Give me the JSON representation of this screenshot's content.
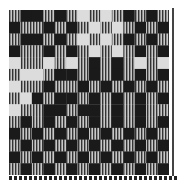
{
  "image": {
    "subject": "woven textile sample with checkered block pattern",
    "colors": {
      "dark": "#1a1a1a",
      "light": "#dcdcdc",
      "stripe_dark": "#3a3a3a",
      "stripe_light": "#bdbdbd"
    },
    "grid": {
      "cols": 14,
      "rows": 14,
      "legend": {
        "0": "light",
        "1": "dark",
        "2": "striped"
      },
      "cells": [
        [
          2,
          1,
          1,
          2,
          1,
          2,
          0,
          2,
          0,
          2,
          1,
          2,
          1,
          2
        ],
        [
          1,
          2,
          2,
          1,
          2,
          1,
          2,
          0,
          2,
          0,
          2,
          1,
          2,
          1
        ],
        [
          2,
          1,
          1,
          2,
          1,
          2,
          0,
          2,
          0,
          2,
          1,
          2,
          1,
          2
        ],
        [
          1,
          2,
          2,
          1,
          2,
          1,
          2,
          0,
          2,
          0,
          2,
          1,
          2,
          1
        ],
        [
          0,
          2,
          2,
          0,
          2,
          0,
          2,
          1,
          2,
          1,
          2,
          0,
          2,
          0
        ],
        [
          2,
          0,
          0,
          2,
          1,
          1,
          2,
          1,
          2,
          1,
          2,
          1,
          2,
          1
        ],
        [
          0,
          2,
          2,
          1,
          2,
          2,
          1,
          2,
          1,
          2,
          1,
          2,
          1,
          2
        ],
        [
          2,
          0,
          1,
          2,
          1,
          1,
          2,
          1,
          2,
          1,
          2,
          1,
          2,
          1
        ],
        [
          0,
          2,
          2,
          1,
          1,
          2,
          1,
          1,
          2,
          1,
          2,
          1,
          2,
          2
        ],
        [
          2,
          1,
          2,
          1,
          2,
          1,
          2,
          1,
          2,
          1,
          2,
          1,
          2,
          1
        ],
        [
          1,
          2,
          1,
          2,
          1,
          2,
          1,
          2,
          1,
          2,
          1,
          2,
          1,
          2
        ],
        [
          2,
          1,
          2,
          1,
          2,
          1,
          2,
          1,
          2,
          1,
          2,
          1,
          2,
          1
        ],
        [
          1,
          2,
          1,
          2,
          1,
          2,
          1,
          2,
          1,
          2,
          1,
          2,
          1,
          2
        ],
        [
          2,
          1,
          2,
          1,
          2,
          1,
          2,
          1,
          2,
          1,
          2,
          1,
          2,
          1
        ]
      ]
    }
  }
}
